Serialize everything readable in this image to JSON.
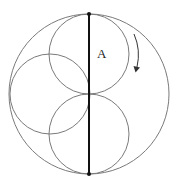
{
  "diagram": {
    "label_a": "A",
    "colors": {
      "circle_stroke": "#7a7a7a",
      "diameter_stroke": "#111111",
      "arrow": "#333333",
      "text": "#222222"
    },
    "outer_circle": {
      "cx": 89,
      "cy": 94,
      "r": 80
    },
    "inner_circles": [
      {
        "name": "top",
        "cx": 89,
        "cy": 54,
        "r": 40
      },
      {
        "name": "left",
        "cx": 50,
        "cy": 94,
        "r": 40
      },
      {
        "name": "bottom",
        "cx": 89,
        "cy": 134,
        "r": 40
      }
    ],
    "diameter": {
      "x": 89,
      "y1": 14,
      "y2": 174
    },
    "endpoints": [
      {
        "name": "top",
        "x": 89,
        "y": 14
      },
      {
        "name": "bottom",
        "x": 89,
        "y": 174
      }
    ],
    "rotation_arrow": {
      "direction": "clockwise"
    }
  }
}
